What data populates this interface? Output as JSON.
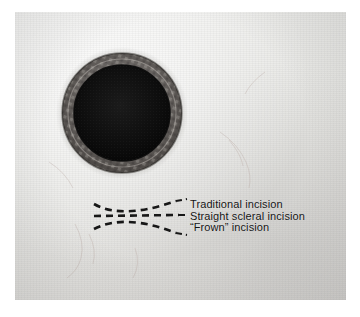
{
  "labels": [
    {
      "id": "traditional",
      "text": "Traditional incision"
    },
    {
      "id": "straight-scleral",
      "text": "Straight scleral incision"
    },
    {
      "id": "frown",
      "text": "“Frown” incision"
    }
  ],
  "annotations": {
    "incision_lines": [
      {
        "id": "traditional",
        "shape": "curve-concave-down",
        "label_ref": "traditional"
      },
      {
        "id": "straight-scleral",
        "shape": "straight",
        "label_ref": "straight-scleral"
      },
      {
        "id": "frown",
        "shape": "curve-concave-up",
        "label_ref": "frown"
      }
    ],
    "line_style": "dashed",
    "line_color": "#1a1a1a"
  },
  "eye": {
    "iris_ring_color": "#6a6763",
    "pupil_color": "#0d0d0d",
    "sclera_color": "#e6e5e2",
    "center_x": 122,
    "center_y": 113,
    "outer_radius": 60,
    "inner_radius": 48
  },
  "colors": {
    "background": "#ffffff",
    "photo_background": "#e9e9e7",
    "text": "#141414"
  }
}
